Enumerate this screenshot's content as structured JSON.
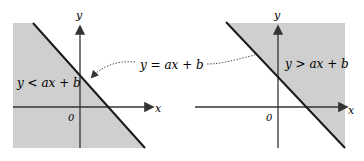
{
  "left": {
    "region_label": "y < ax + b",
    "x_label": "x",
    "y_label": "y",
    "origin_label": "0"
  },
  "right": {
    "region_label": "y > ax + b",
    "x_label": "x",
    "y_label": "y",
    "origin_label": "0"
  },
  "boundary_label": "y = ax + b",
  "colors": {
    "shade": "#cfcfcf",
    "line": "#1a1a1a",
    "axis": "#333333"
  }
}
